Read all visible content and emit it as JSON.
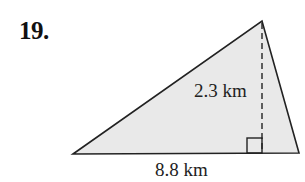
{
  "problem": {
    "number": "19."
  },
  "figure": {
    "shape": "triangle",
    "fill_color": "#e9e9e9",
    "stroke_color": "#222222",
    "base_label": "8.8 km",
    "height_label": "2.3 km",
    "vertices": {
      "left": [
        73,
        154
      ],
      "apex": [
        262,
        21
      ],
      "right": [
        299,
        153
      ]
    },
    "height_foot": [
      262,
      153
    ],
    "right_angle_marker": true
  }
}
